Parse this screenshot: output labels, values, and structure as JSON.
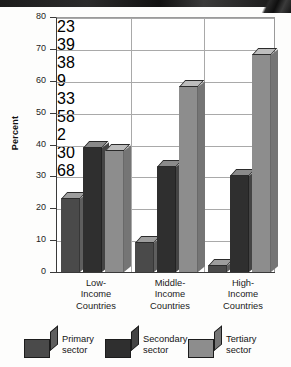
{
  "chart_data": {
    "type": "bar",
    "title": "",
    "subtitle": "",
    "xlabel": "",
    "ylabel": "Percent",
    "ylim": [
      0,
      80
    ],
    "yticks": [
      0,
      10,
      20,
      30,
      40,
      50,
      60,
      70,
      80
    ],
    "grid": true,
    "legend_position": "bottom",
    "categories": [
      "Low-\nIncome\nCountries",
      "Middle-\nIncome\nCountries",
      "High-\nIncome\nCountries"
    ],
    "series": [
      {
        "name": "Primary sector",
        "values": [
          23,
          9,
          2
        ],
        "color": "#4a4a4a"
      },
      {
        "name": "Secondary sector",
        "values": [
          39,
          33,
          30
        ],
        "color": "#333333"
      },
      {
        "name": "Tertiary sector",
        "values": [
          38,
          58,
          68
        ],
        "color": "#8e8e8e"
      }
    ],
    "data_labels": [
      {
        "group": "Low-Income Countries",
        "series": "Primary sector",
        "value": "23"
      },
      {
        "group": "Low-Income Countries",
        "series": "Secondary sector",
        "value": "39"
      },
      {
        "group": "Low-Income Countries",
        "series": "Tertiary sector",
        "value": "38"
      },
      {
        "group": "Middle-Income Countries",
        "series": "Primary sector",
        "value": "9"
      },
      {
        "group": "Middle-Income Countries",
        "series": "Secondary sector",
        "value": "33"
      },
      {
        "group": "Middle-Income Countries",
        "series": "Tertiary sector",
        "value": "58"
      },
      {
        "group": "High-Income Countries",
        "series": "Primary sector",
        "value": "2"
      },
      {
        "group": "High-Income Countries",
        "series": "Secondary sector",
        "value": "30"
      },
      {
        "group": "High-Income Countries",
        "series": "Tertiary sector",
        "value": "68"
      }
    ]
  },
  "axis": {
    "y_title": "Percent",
    "y_tick_labels": [
      "80",
      "70",
      "60",
      "50",
      "40",
      "30",
      "20",
      "10",
      "0"
    ]
  },
  "x_labels": [
    {
      "line1": "Low-",
      "line2": "Income",
      "line3": "Countries"
    },
    {
      "line1": "Middle-",
      "line2": "Income",
      "line3": "Countries"
    },
    {
      "line1": "High-",
      "line2": "Income",
      "line3": "Countries"
    }
  ],
  "x_labels_text": [
    "Low-\nIncome\nCountries",
    "Middle-\nIncome\nCountries",
    "High-\nIncome\nCountries"
  ],
  "labels": {
    "v_low_primary": "23",
    "v_low_secondary": "39",
    "v_low_tertiary": "38",
    "v_mid_primary": "9",
    "v_mid_secondary": "33",
    "v_mid_tertiary": "58",
    "v_high_primary": "2",
    "v_high_secondary": "30",
    "v_high_tertiary": "68"
  },
  "legend": {
    "items": [
      {
        "label": "Primary sector",
        "icon": "cube-swatch-primary",
        "color": "#4a4a4a"
      },
      {
        "label": "Secondary sector",
        "icon": "cube-swatch-secondary",
        "color": "#333333"
      },
      {
        "label": "Tertiary sector",
        "icon": "cube-swatch-tertiary",
        "color": "#8e8e8e"
      }
    ]
  },
  "colors": {
    "primary_front": "#4a4a4a",
    "primary_side": "#5e5e5e",
    "primary_top": "#9d9d9d",
    "secondary_front": "#2f2f2f",
    "secondary_side": "#444444",
    "secondary_top": "#8a8a8a",
    "tertiary_front": "#8d8d8d",
    "tertiary_side": "#757575",
    "tertiary_top": "#bdbdbd",
    "axis": "#3a3a3a",
    "grid": "#a9a9a9",
    "background": "#ffffff"
  }
}
